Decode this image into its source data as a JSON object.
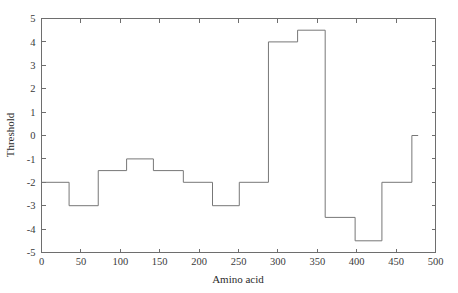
{
  "chart_data": {
    "type": "line",
    "title": "",
    "subtitle": "",
    "xlabel": "Amino acid",
    "ylabel": "Threshold",
    "xlim": [
      0,
      500
    ],
    "ylim": [
      -5,
      5
    ],
    "xticks": [
      0,
      50,
      100,
      150,
      200,
      250,
      300,
      350,
      400,
      450,
      500
    ],
    "xtick_labels": [
      "0",
      "50",
      "100",
      "150",
      "200",
      "250",
      "300",
      "350",
      "400",
      "450",
      "500"
    ],
    "yticks": [
      -5,
      -4,
      -3,
      -2,
      -1,
      0,
      1,
      2,
      3,
      4,
      5
    ],
    "ytick_labels": [
      "-5",
      "-4",
      "-3",
      "-2",
      "-1",
      "0",
      "1",
      "2",
      "3",
      "4",
      "5"
    ],
    "grid": false,
    "legend": "none",
    "line_style": "step-post",
    "line_color": "#777777",
    "frame_color": "#6e6e6e",
    "series": [
      {
        "name": "Threshold profile",
        "step_segments": [
          {
            "x_start": 0,
            "x_end": 35,
            "value": -2
          },
          {
            "x_start": 35,
            "x_end": 72,
            "value": -3
          },
          {
            "x_start": 72,
            "x_end": 108,
            "value": -1.5
          },
          {
            "x_start": 108,
            "x_end": 142,
            "value": -1
          },
          {
            "x_start": 142,
            "x_end": 180,
            "value": -1.5
          },
          {
            "x_start": 180,
            "x_end": 217,
            "value": -2
          },
          {
            "x_start": 217,
            "x_end": 251,
            "value": -3
          },
          {
            "x_start": 251,
            "x_end": 288,
            "value": -2
          },
          {
            "x_start": 288,
            "x_end": 325,
            "value": 4
          },
          {
            "x_start": 325,
            "x_end": 360,
            "value": 4.5
          },
          {
            "x_start": 360,
            "x_end": 398,
            "value": -3.5
          },
          {
            "x_start": 398,
            "x_end": 432,
            "value": -4.5
          },
          {
            "x_start": 432,
            "x_end": 470,
            "value": -2
          },
          {
            "x_start": 470,
            "x_end": 478,
            "value": 0
          }
        ],
        "x": [
          0,
          35,
          35,
          72,
          72,
          108,
          108,
          142,
          142,
          180,
          180,
          217,
          217,
          251,
          251,
          288,
          288,
          325,
          325,
          360,
          360,
          398,
          398,
          432,
          432,
          470,
          470,
          478
        ],
        "y": [
          -2,
          -2,
          -3,
          -3,
          -1.5,
          -1.5,
          -1,
          -1,
          -1.5,
          -1.5,
          -2,
          -2,
          -3,
          -3,
          -2,
          -2,
          4,
          4,
          4.5,
          4.5,
          -3.5,
          -3.5,
          -4.5,
          -4.5,
          -2,
          -2,
          0,
          0
        ]
      }
    ]
  }
}
